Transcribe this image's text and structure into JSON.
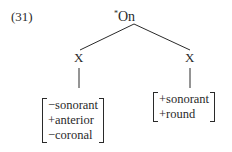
{
  "example_number": "(31)",
  "tree": {
    "root": {
      "prefix": "*",
      "label": "On"
    },
    "children": [
      {
        "label": "X",
        "features": [
          "−sonorant",
          "+anterior",
          "−coronal"
        ]
      },
      {
        "label": "X",
        "features": [
          "+sonorant",
          "+round"
        ]
      }
    ]
  }
}
